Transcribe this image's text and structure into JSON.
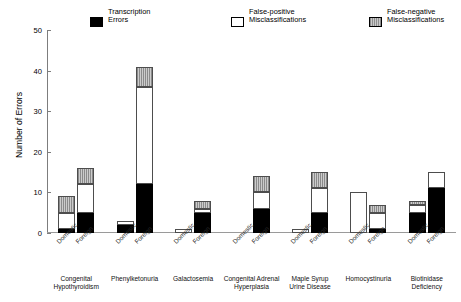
{
  "chart_data": {
    "type": "bar",
    "title": "",
    "xlabel": "",
    "ylabel": "Number of Errors",
    "ylim": [
      0,
      50
    ],
    "ytick_labels": [
      "0",
      "10",
      "20",
      "30",
      "40",
      "50"
    ],
    "ytick_values": [
      0,
      10,
      20,
      30,
      40,
      50
    ],
    "grid": false,
    "stacked": true,
    "legend_position": "top",
    "legend": [
      {
        "label_line1": "Transcription",
        "label_line2": "Errors",
        "key": "transcription_errors",
        "color": "#000000",
        "swatch": "sw-black"
      },
      {
        "label_line1": "False-positive",
        "label_line2": "Misclassifications",
        "key": "false_positive",
        "color": "#ffffff",
        "swatch": "sw-white"
      },
      {
        "label_line1": "False-negative",
        "label_line2": "Misclassifications",
        "key": "false_negative",
        "color": "#999999",
        "swatch": "sw-gray"
      }
    ],
    "series": [
      {
        "name": "Transcription Errors",
        "key": "transcription_errors"
      },
      {
        "name": "False-positive Misclassifications",
        "key": "false_positive"
      },
      {
        "name": "False-negative Misclassifications",
        "key": "false_negative"
      }
    ],
    "categories": [
      "Congenital\nHypothyroidism",
      "Phenylketonuria",
      "Galactosemia",
      "Congenital Adrenal\nHyperplasia",
      "Maple Syrup\nUrine Disease",
      "Homocystinuria",
      "Biotinidase\nDeficiency"
    ],
    "subcategories": [
      "Domestic",
      "Foreign"
    ],
    "bars": [
      {
        "group": "Congenital Hypothyroidism",
        "sub": "Domestic",
        "transcription_errors": 1,
        "false_positive": 4,
        "false_negative": 4,
        "total": 9
      },
      {
        "group": "Congenital Hypothyroidism",
        "sub": "Foreign",
        "transcription_errors": 5,
        "false_positive": 7,
        "false_negative": 4,
        "total": 16
      },
      {
        "group": "Phenylketonuria",
        "sub": "Domestic",
        "transcription_errors": 2,
        "false_positive": 1,
        "false_negative": 0,
        "total": 3
      },
      {
        "group": "Phenylketonuria",
        "sub": "Foreign",
        "transcription_errors": 12,
        "false_positive": 24,
        "false_negative": 5,
        "total": 41
      },
      {
        "group": "Galactosemia",
        "sub": "Domestic",
        "transcription_errors": 0,
        "false_positive": 1,
        "false_negative": 0,
        "total": 1
      },
      {
        "group": "Galactosemia",
        "sub": "Foreign",
        "transcription_errors": 5,
        "false_positive": 1,
        "false_negative": 2,
        "total": 8
      },
      {
        "group": "Congenital Adrenal Hyperplasia",
        "sub": "Domestic",
        "transcription_errors": 0,
        "false_positive": 0,
        "false_negative": 0,
        "total": 0
      },
      {
        "group": "Congenital Adrenal Hyperplasia",
        "sub": "Foreign",
        "transcription_errors": 6,
        "false_positive": 4,
        "false_negative": 4,
        "total": 14
      },
      {
        "group": "Maple Syrup Urine Disease",
        "sub": "Domestic",
        "transcription_errors": 0,
        "false_positive": 1,
        "false_negative": 0,
        "total": 1
      },
      {
        "group": "Maple Syrup Urine Disease",
        "sub": "Foreign",
        "transcription_errors": 5,
        "false_positive": 6,
        "false_negative": 4,
        "total": 15
      },
      {
        "group": "Homocystinuria",
        "sub": "Domestic",
        "transcription_errors": 0,
        "false_positive": 10,
        "false_negative": 0,
        "total": 10
      },
      {
        "group": "Homocystinuria",
        "sub": "Foreign",
        "transcription_errors": 1,
        "false_positive": 4,
        "false_negative": 2,
        "total": 7
      },
      {
        "group": "Biotinidase Deficiency",
        "sub": "Domestic",
        "transcription_errors": 5,
        "false_positive": 2,
        "false_negative": 1,
        "total": 8
      },
      {
        "group": "Biotinidase Deficiency",
        "sub": "Foreign",
        "transcription_errors": 11,
        "false_positive": 4,
        "false_negative": 0,
        "total": 15
      }
    ]
  }
}
